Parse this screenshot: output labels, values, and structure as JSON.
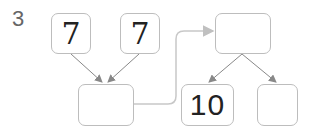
{
  "problem_number": "3",
  "boxes": {
    "top_left": {
      "value": "7"
    },
    "top_middle": {
      "value": "7"
    },
    "bottom_left": {
      "value": ""
    },
    "top_right": {
      "value": ""
    },
    "bottom_middle": {
      "value": "10"
    },
    "bottom_right": {
      "value": ""
    }
  },
  "colors": {
    "box_border": "#bdbdbd",
    "arrow": "#888888",
    "connector": "#c8c8c8"
  }
}
